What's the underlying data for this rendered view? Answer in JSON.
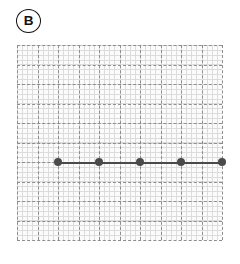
{
  "panel": {
    "label": "B",
    "label_icon": "circled-letter-b"
  },
  "chart_data": {
    "type": "line",
    "title": "",
    "subtitle": "",
    "xlabel": "",
    "ylabel": "",
    "xlim": [
      0,
      10
    ],
    "ylim": [
      0,
      10
    ],
    "xticklabels": [],
    "yticklabels": [],
    "grid": true,
    "grid_major_cells_x": 10,
    "grid_major_cells_y": 10,
    "grid_minor_subdivisions": 4,
    "legend": false,
    "legend_position": "none",
    "annotations": [],
    "series": [
      {
        "name": "B",
        "marker": "circle",
        "marker_color": "#4a4a4a",
        "line_color": "#4a4a4a",
        "x": [
          2,
          4,
          6,
          8,
          10
        ],
        "values": [
          4,
          4,
          4,
          4,
          4
        ]
      }
    ]
  },
  "colors": {
    "background": "#ffffff",
    "plot_background": "#fbfbfb",
    "grid_major": "#8e8e8e",
    "grid_minor": "#dcdcdc",
    "series": "#4a4a4a",
    "label": "#111111"
  }
}
